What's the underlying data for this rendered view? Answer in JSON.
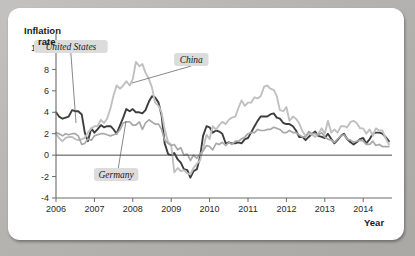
{
  "figure": {
    "background_color": "#b9b8b4",
    "card_color": "#ffffff"
  },
  "chart_data": {
    "type": "line",
    "title": "",
    "xlabel": "Year",
    "ylabel": "Inflation rate",
    "ylabel_line1": "Inflation",
    "ylabel_line2": "rate",
    "xlim": [
      2006.0,
      2014.75
    ],
    "ylim": [
      -4,
      10
    ],
    "yticks": [
      10,
      8,
      6,
      4,
      2,
      0,
      -2,
      -4
    ],
    "ytick_labels": [
      "10%",
      "8",
      "6",
      "4",
      "2",
      "0",
      "-2",
      "-4"
    ],
    "xticks": [
      2006,
      2007,
      2008,
      2009,
      2010,
      2011,
      2012,
      2013,
      2014
    ],
    "xtick_labels": [
      "2006",
      "2007",
      "2008",
      "2009",
      "2010",
      "2011",
      "2012",
      "2013",
      "2014"
    ],
    "grid": false,
    "legend_position": "annotations-on-plot",
    "annotations": [
      {
        "text": "United States",
        "series": "United States",
        "x": 26,
        "y": 32,
        "anchor_x": 68,
        "anchor_y": 115
      },
      {
        "text": "China",
        "series": "China",
        "x": 166,
        "y": 45,
        "anchor_x": 124,
        "anchor_y": 75
      },
      {
        "text": "Germany",
        "series": "Germany",
        "x": 86,
        "y": 160,
        "anchor_x": 118,
        "anchor_y": 113
      }
    ],
    "series": [
      {
        "name": "United States",
        "color": "#3d3d3d",
        "width": 1.9,
        "x": [
          2006.0,
          2006.08,
          2006.17,
          2006.25,
          2006.33,
          2006.42,
          2006.5,
          2006.58,
          2006.67,
          2006.75,
          2006.83,
          2006.92,
          2007.0,
          2007.08,
          2007.17,
          2007.25,
          2007.33,
          2007.42,
          2007.5,
          2007.58,
          2007.67,
          2007.75,
          2007.83,
          2007.92,
          2008.0,
          2008.08,
          2008.17,
          2008.25,
          2008.33,
          2008.42,
          2008.5,
          2008.58,
          2008.67,
          2008.75,
          2008.83,
          2008.92,
          2009.0,
          2009.08,
          2009.17,
          2009.25,
          2009.33,
          2009.42,
          2009.5,
          2009.58,
          2009.67,
          2009.75,
          2009.83,
          2009.92,
          2010.0,
          2010.08,
          2010.17,
          2010.25,
          2010.33,
          2010.42,
          2010.5,
          2010.58,
          2010.67,
          2010.75,
          2010.83,
          2010.92,
          2011.0,
          2011.08,
          2011.17,
          2011.25,
          2011.33,
          2011.42,
          2011.5,
          2011.58,
          2011.67,
          2011.75,
          2011.83,
          2011.92,
          2012.0,
          2012.08,
          2012.17,
          2012.25,
          2012.33,
          2012.42,
          2012.5,
          2012.58,
          2012.67,
          2012.75,
          2012.83,
          2012.92,
          2013.0,
          2013.08,
          2013.17,
          2013.25,
          2013.33,
          2013.42,
          2013.5,
          2013.58,
          2013.67,
          2013.75,
          2013.83,
          2013.92,
          2014.0,
          2014.08,
          2014.17,
          2014.25,
          2014.33,
          2014.42,
          2014.5,
          2014.58,
          2014.67
        ],
        "y": [
          4.0,
          3.6,
          3.4,
          3.5,
          3.6,
          4.2,
          4.1,
          4.1,
          3.8,
          2.1,
          1.3,
          2.5,
          2.1,
          2.4,
          2.8,
          2.6,
          2.7,
          2.7,
          2.4,
          2.0,
          2.8,
          3.5,
          4.3,
          4.1,
          4.3,
          4.0,
          4.0,
          3.9,
          4.2,
          5.0,
          5.5,
          5.4,
          4.9,
          3.7,
          1.1,
          0.1,
          0.0,
          0.2,
          -0.4,
          -0.7,
          -1.3,
          -1.4,
          -2.1,
          -1.5,
          -1.3,
          -0.2,
          1.8,
          2.7,
          2.6,
          2.1,
          2.3,
          2.2,
          2.0,
          1.1,
          1.2,
          1.1,
          1.1,
          1.2,
          1.1,
          1.5,
          1.6,
          2.1,
          2.7,
          3.2,
          3.6,
          3.6,
          3.6,
          3.8,
          3.9,
          3.5,
          3.4,
          3.0,
          2.9,
          2.9,
          2.7,
          2.3,
          1.7,
          1.7,
          1.4,
          1.7,
          2.0,
          2.2,
          1.8,
          1.7,
          1.6,
          2.0,
          1.5,
          1.1,
          1.4,
          1.8,
          2.0,
          1.5,
          1.2,
          1.0,
          1.2,
          1.5,
          1.6,
          1.1,
          1.5,
          2.0,
          2.1,
          2.1,
          2.0,
          1.7,
          1.3
        ]
      },
      {
        "name": "China",
        "color": "#c0c0c0",
        "width": 1.9,
        "x": [
          2006.0,
          2006.08,
          2006.17,
          2006.25,
          2006.33,
          2006.42,
          2006.5,
          2006.58,
          2006.67,
          2006.75,
          2006.83,
          2006.92,
          2007.0,
          2007.08,
          2007.17,
          2007.25,
          2007.33,
          2007.42,
          2007.5,
          2007.58,
          2007.67,
          2007.75,
          2007.83,
          2007.92,
          2008.0,
          2008.08,
          2008.17,
          2008.25,
          2008.33,
          2008.42,
          2008.5,
          2008.58,
          2008.67,
          2008.75,
          2008.83,
          2008.92,
          2009.0,
          2009.08,
          2009.17,
          2009.25,
          2009.33,
          2009.42,
          2009.5,
          2009.58,
          2009.67,
          2009.75,
          2009.83,
          2009.92,
          2010.0,
          2010.08,
          2010.17,
          2010.25,
          2010.33,
          2010.42,
          2010.5,
          2010.58,
          2010.67,
          2010.75,
          2010.83,
          2010.92,
          2011.0,
          2011.08,
          2011.17,
          2011.25,
          2011.33,
          2011.42,
          2011.5,
          2011.58,
          2011.67,
          2011.75,
          2011.83,
          2011.92,
          2012.0,
          2012.08,
          2012.17,
          2012.25,
          2012.33,
          2012.42,
          2012.5,
          2012.58,
          2012.67,
          2012.75,
          2012.83,
          2012.92,
          2013.0,
          2013.08,
          2013.17,
          2013.25,
          2013.33,
          2013.42,
          2013.5,
          2013.58,
          2013.67,
          2013.75,
          2013.83,
          2013.92,
          2014.0,
          2014.08,
          2014.17,
          2014.25,
          2014.33,
          2014.42,
          2014.5,
          2014.58,
          2014.67
        ],
        "y": [
          2.0,
          1.6,
          1.3,
          1.6,
          1.7,
          1.7,
          1.5,
          1.4,
          1.5,
          1.6,
          2.1,
          2.5,
          2.7,
          2.7,
          3.3,
          3.0,
          3.4,
          4.4,
          5.6,
          6.5,
          6.2,
          6.5,
          6.9,
          6.5,
          7.1,
          8.7,
          8.3,
          8.5,
          7.7,
          7.1,
          6.3,
          4.9,
          4.6,
          4.0,
          2.4,
          1.2,
          1.0,
          -1.6,
          -1.2,
          -1.5,
          -1.4,
          -1.7,
          -1.8,
          -1.2,
          -0.8,
          -0.5,
          0.6,
          1.9,
          1.5,
          2.7,
          2.4,
          2.8,
          3.1,
          2.9,
          3.3,
          3.5,
          3.6,
          4.4,
          5.1,
          4.6,
          4.9,
          4.9,
          5.4,
          5.3,
          5.5,
          6.4,
          6.5,
          6.2,
          6.1,
          5.5,
          4.2,
          4.1,
          4.5,
          3.2,
          3.6,
          3.4,
          3.0,
          2.2,
          1.8,
          2.0,
          1.9,
          1.7,
          2.0,
          2.5,
          2.0,
          3.2,
          2.1,
          2.4,
          2.1,
          2.7,
          2.7,
          2.6,
          3.1,
          3.2,
          3.0,
          2.5,
          2.5,
          2.0,
          2.4,
          1.8,
          2.5,
          2.3,
          2.3,
          1.6,
          1.0
        ]
      },
      {
        "name": "Germany",
        "color": "#a8a8a8",
        "width": 1.7,
        "x": [
          2006.0,
          2006.08,
          2006.17,
          2006.25,
          2006.33,
          2006.42,
          2006.5,
          2006.58,
          2006.67,
          2006.75,
          2006.83,
          2006.92,
          2007.0,
          2007.08,
          2007.17,
          2007.25,
          2007.33,
          2007.42,
          2007.5,
          2007.58,
          2007.67,
          2007.75,
          2007.83,
          2007.92,
          2008.0,
          2008.08,
          2008.17,
          2008.25,
          2008.33,
          2008.42,
          2008.5,
          2008.58,
          2008.67,
          2008.75,
          2008.83,
          2008.92,
          2009.0,
          2009.08,
          2009.17,
          2009.25,
          2009.33,
          2009.42,
          2009.5,
          2009.58,
          2009.67,
          2009.75,
          2009.83,
          2009.92,
          2010.0,
          2010.08,
          2010.17,
          2010.25,
          2010.33,
          2010.42,
          2010.5,
          2010.58,
          2010.67,
          2010.75,
          2010.83,
          2010.92,
          2011.0,
          2011.08,
          2011.17,
          2011.25,
          2011.33,
          2011.42,
          2011.5,
          2011.58,
          2011.67,
          2011.75,
          2011.83,
          2011.92,
          2012.0,
          2012.08,
          2012.17,
          2012.25,
          2012.33,
          2012.42,
          2012.5,
          2012.58,
          2012.67,
          2012.75,
          2012.83,
          2012.92,
          2013.0,
          2013.08,
          2013.17,
          2013.25,
          2013.33,
          2013.42,
          2013.5,
          2013.58,
          2013.67,
          2013.75,
          2013.83,
          2013.92,
          2014.0,
          2014.08,
          2014.17,
          2014.25,
          2014.33,
          2014.42,
          2014.5,
          2014.58,
          2014.67
        ],
        "y": [
          2.1,
          2.0,
          1.8,
          2.0,
          1.9,
          2.0,
          2.0,
          1.8,
          1.0,
          1.1,
          1.5,
          1.4,
          1.8,
          1.9,
          2.0,
          2.0,
          1.9,
          1.8,
          1.9,
          2.0,
          2.4,
          3.0,
          3.1,
          3.1,
          2.8,
          2.8,
          3.1,
          2.4,
          3.0,
          3.3,
          3.1,
          2.9,
          2.9,
          2.4,
          1.4,
          1.1,
          0.9,
          1.0,
          0.5,
          0.7,
          0.0,
          0.1,
          -0.5,
          0.0,
          -0.3,
          0.1,
          0.4,
          0.9,
          0.8,
          0.5,
          1.1,
          1.0,
          1.2,
          0.9,
          1.2,
          1.0,
          1.3,
          1.3,
          1.5,
          1.7,
          2.0,
          2.1,
          2.1,
          2.4,
          2.3,
          2.3,
          2.4,
          2.4,
          2.6,
          2.5,
          2.4,
          2.1,
          2.1,
          2.3,
          2.1,
          2.1,
          1.9,
          1.7,
          1.7,
          2.2,
          2.0,
          2.0,
          1.9,
          2.1,
          1.7,
          1.5,
          1.4,
          1.2,
          1.5,
          1.8,
          1.9,
          1.5,
          1.4,
          1.2,
          1.3,
          1.4,
          1.3,
          1.0,
          1.0,
          1.3,
          0.9,
          1.0,
          0.8,
          0.8,
          0.8
        ]
      }
    ]
  }
}
